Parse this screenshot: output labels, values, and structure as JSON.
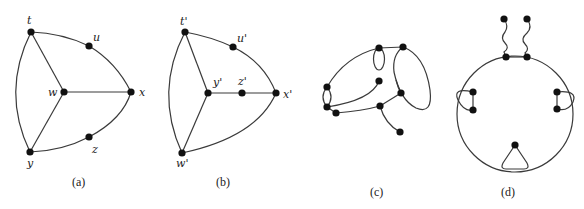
{
  "figure": {
    "panels": [
      {
        "id": "a",
        "caption": "(a)",
        "vertices": [
          {
            "label": "t",
            "x": 31,
            "y": 32
          },
          {
            "label": "u",
            "x": 89,
            "y": 46
          },
          {
            "label": "w",
            "x": 64,
            "y": 92
          },
          {
            "label": "x",
            "x": 131,
            "y": 92
          },
          {
            "label": "z",
            "x": 89,
            "y": 137
          },
          {
            "label": "y",
            "x": 30,
            "y": 152
          }
        ],
        "edges": [
          [
            "t",
            "u"
          ],
          [
            "u",
            "x"
          ],
          [
            "t",
            "w"
          ],
          [
            "w",
            "x"
          ],
          [
            "w",
            "y"
          ],
          [
            "t",
            "y"
          ],
          [
            "y",
            "z"
          ],
          [
            "z",
            "x"
          ]
        ]
      },
      {
        "id": "b",
        "caption": "(b)",
        "vertices": [
          {
            "label": "t'",
            "x": 185,
            "y": 32
          },
          {
            "label": "u'",
            "x": 233,
            "y": 47
          },
          {
            "label": "y'",
            "x": 208,
            "y": 93
          },
          {
            "label": "z'",
            "x": 242,
            "y": 93
          },
          {
            "label": "x'",
            "x": 276,
            "y": 93
          },
          {
            "label": "w'",
            "x": 182,
            "y": 153
          }
        ],
        "edges": [
          [
            "t'",
            "u'"
          ],
          [
            "u'",
            "x'"
          ],
          [
            "t'",
            "y'"
          ],
          [
            "y'",
            "z'"
          ],
          [
            "z'",
            "x'"
          ],
          [
            "y'",
            "w'"
          ],
          [
            "t'",
            "w'"
          ],
          [
            "w'",
            "x'"
          ]
        ]
      },
      {
        "id": "c",
        "caption": "(c)",
        "vertex_count": 9,
        "description": "graph with two small loops/multi-edges, a large loop and pendant vertices"
      },
      {
        "id": "d",
        "caption": "(d)",
        "vertex_count": 9,
        "description": "cycle with two wavy pendant edges on top, parallel-edge loops on left and right, and a triangular loop at bottom"
      }
    ]
  }
}
